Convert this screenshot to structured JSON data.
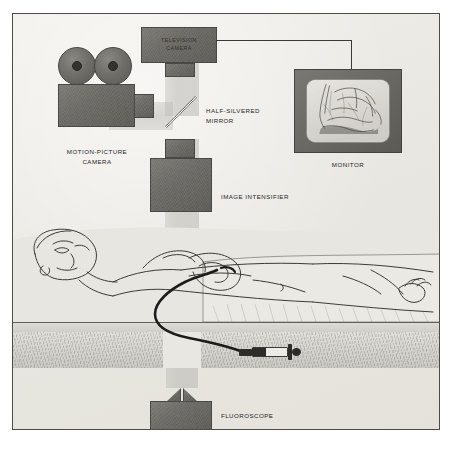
{
  "figure": {
    "background_color": "#eceae5",
    "equipment_color": "#6d6b66",
    "beam_color": "#bab8b2",
    "ink_color": "#27251f"
  },
  "labels": {
    "television_camera": "TELEVISION\nCAMERA",
    "half_silvered_mirror": "HALF-SILVERED\nMIRROR",
    "motion_picture_camera": "MOTION-PICTURE\nCAMERA",
    "image_intensifier": "IMAGE  INTENSIFIER",
    "monitor": "MONITOR",
    "fluoroscope": "FLUOROSCOPE"
  },
  "components": [
    {
      "name": "television-camera",
      "label": "TELEVISION CAMERA",
      "label_position": "inside",
      "role": "Captures the intensified image for live video display"
    },
    {
      "name": "motion-picture-camera",
      "label": "MOTION-PICTURE CAMERA",
      "label_position": "below",
      "role": "Records cine film of the intensified image",
      "detail": "Twin film reels above a boxed body with lens"
    },
    {
      "name": "half-silvered-mirror",
      "label": "HALF-SILVERED MIRROR",
      "label_position": "right",
      "role": "Splits the light beam to both cameras",
      "angle_degrees": 45
    },
    {
      "name": "image-intensifier",
      "label": "IMAGE INTENSIFIER",
      "label_position": "right",
      "role": "Amplifies the faint X-ray image emerging from the patient"
    },
    {
      "name": "monitor",
      "label": "MONITOR",
      "label_position": "below",
      "role": "Displays the live fluoroscopic image",
      "screen_content": "fluoroscopic radiograph of the chest"
    },
    {
      "name": "fluoroscope",
      "label": "FLUOROSCOPE",
      "label_position": "right",
      "role": "X-ray source beneath the table"
    },
    {
      "name": "patient",
      "label": "",
      "label_position": "none",
      "role": "Supine patient on the examination table with a cardiac catheter in place"
    },
    {
      "name": "syringe",
      "label": "",
      "label_position": "none",
      "role": "Contrast-injection syringe connected to the catheter"
    }
  ]
}
